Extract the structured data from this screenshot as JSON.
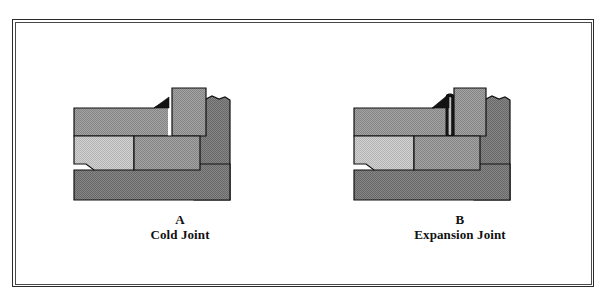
{
  "figure": {
    "type": "technical-cross-section",
    "frame": {
      "outer_color": "#2b2b2b",
      "inner_color": "#4a4a4a"
    }
  },
  "palette": {
    "outline": "#111111",
    "wall_gray": "#8e8e8e",
    "slab_light": "#c8c8c8",
    "slab_mid": "#9a9a9a",
    "base_dark": "#7b7b7b",
    "filler_dark": "#151515",
    "gap_white": "#ffffff",
    "page_white": "#ffffff"
  },
  "panels": [
    {
      "id": "a",
      "letter": "A",
      "title": "Cold Joint",
      "joint_kind": "cold-joint",
      "joint_fill": "none",
      "joint_width_px": 3
    },
    {
      "id": "b",
      "letter": "B",
      "title": "Expansion Joint",
      "joint_kind": "expansion-joint",
      "joint_fill": "compressible-filler",
      "joint_width_px": 7
    }
  ],
  "parts": {
    "upper_wall_left": "upper-wall-left",
    "upper_wall_column": "upper-wall-column",
    "right_wall_broken": "right-wall-broken-edge",
    "slab_light": "slab-left-light",
    "slab_mid": "slab-right-mid",
    "base": "base-soil-fill",
    "wedge": "joint-wedge",
    "filler": "joint-filler-strip"
  }
}
